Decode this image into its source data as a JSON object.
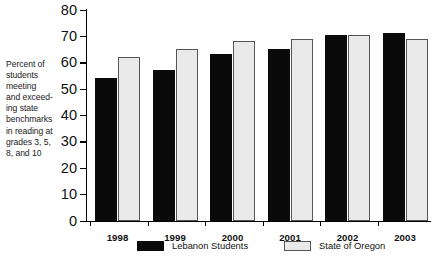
{
  "chart_data": {
    "type": "bar",
    "title": "",
    "xlabel": "",
    "ylabel": "Percent of\nstudents\nmeeting\nand exceed-\ning state\nbenchmarks\nin reading at\ngrades 3, 5,\n8, and 10",
    "categories": [
      "1998",
      "1999",
      "2000",
      "2001",
      "2002",
      "2003"
    ],
    "series": [
      {
        "name": "Lebanon Students",
        "color": "#0a0a0a",
        "values": [
          54,
          57,
          63,
          65,
          70.5,
          71
        ]
      },
      {
        "name": "State of Oregon",
        "color": "#e9e9e9",
        "values": [
          62,
          65,
          68,
          69,
          70.5,
          69
        ]
      }
    ],
    "ylim": [
      0,
      80
    ],
    "ytick_values": [
      80,
      70,
      60,
      50,
      40,
      30,
      20,
      10,
      0
    ],
    "ytick_labels": [
      "80",
      "70",
      "60",
      "50",
      "40",
      "30",
      "20",
      "10",
      "0"
    ],
    "grid": false,
    "legend_position": "bottom"
  },
  "axis": {
    "caption": "Percent of\nstudents\nmeeting\nand exceed-\ning state\nbenchmarks\nin reading at\ngrades 3, 5,\n8, and 10",
    "ticks": [
      {
        "label": "80"
      },
      {
        "label": "70"
      },
      {
        "label": "60"
      },
      {
        "label": "50"
      },
      {
        "label": "40"
      },
      {
        "label": "30"
      },
      {
        "label": "20"
      },
      {
        "label": "10"
      },
      {
        "label": "0"
      }
    ]
  },
  "groups": [
    {
      "year": "1998",
      "lebanon": 54,
      "oregon": 62
    },
    {
      "year": "1999",
      "lebanon": 57,
      "oregon": 65
    },
    {
      "year": "2000",
      "lebanon": 63,
      "oregon": 68
    },
    {
      "year": "2001",
      "lebanon": 65,
      "oregon": 69
    },
    {
      "year": "2002",
      "lebanon": 70.5,
      "oregon": 70.5
    },
    {
      "year": "2003",
      "lebanon": 71,
      "oregon": 69
    }
  ],
  "legend": {
    "items": [
      {
        "label": "Lebanon Students",
        "color": "#0a0a0a"
      },
      {
        "label": "State of Oregon",
        "color": "#e9e9e9"
      }
    ]
  }
}
